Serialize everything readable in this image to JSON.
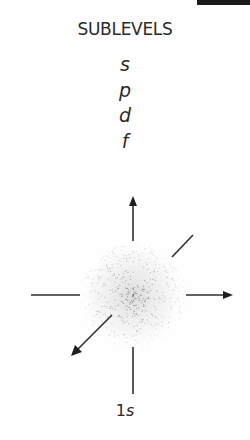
{
  "title": "SUBLEVELS",
  "sublevels": [
    "s",
    "p",
    "d",
    "f"
  ],
  "orbital": {
    "label_number": "1",
    "label_letter": "s",
    "shape": "spherical-dot-cloud",
    "axes": [
      "x",
      "y",
      "z"
    ]
  },
  "colors": {
    "ink": "#2a2a2a",
    "background": "#fefefe",
    "corner_bar": "#1a1a1a"
  }
}
